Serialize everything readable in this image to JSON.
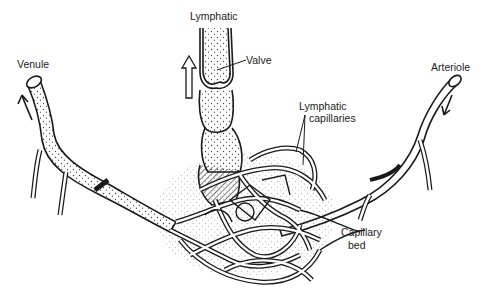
{
  "diagram": {
    "type": "anatomical-illustration",
    "labels": {
      "lymphatic": "Lymphatic",
      "valve": "Valve",
      "venule": "Venule",
      "arteriole": "Arteriole",
      "lymphatic_capillaries_line1": "Lymphatic",
      "lymphatic_capillaries_line2": "capillaries",
      "capillary_bed_line1": "Capillary",
      "capillary_bed_line2": "bed"
    },
    "colors": {
      "ink": "#1a1a1a",
      "background": "#ffffff",
      "stipple": "#555555"
    }
  }
}
